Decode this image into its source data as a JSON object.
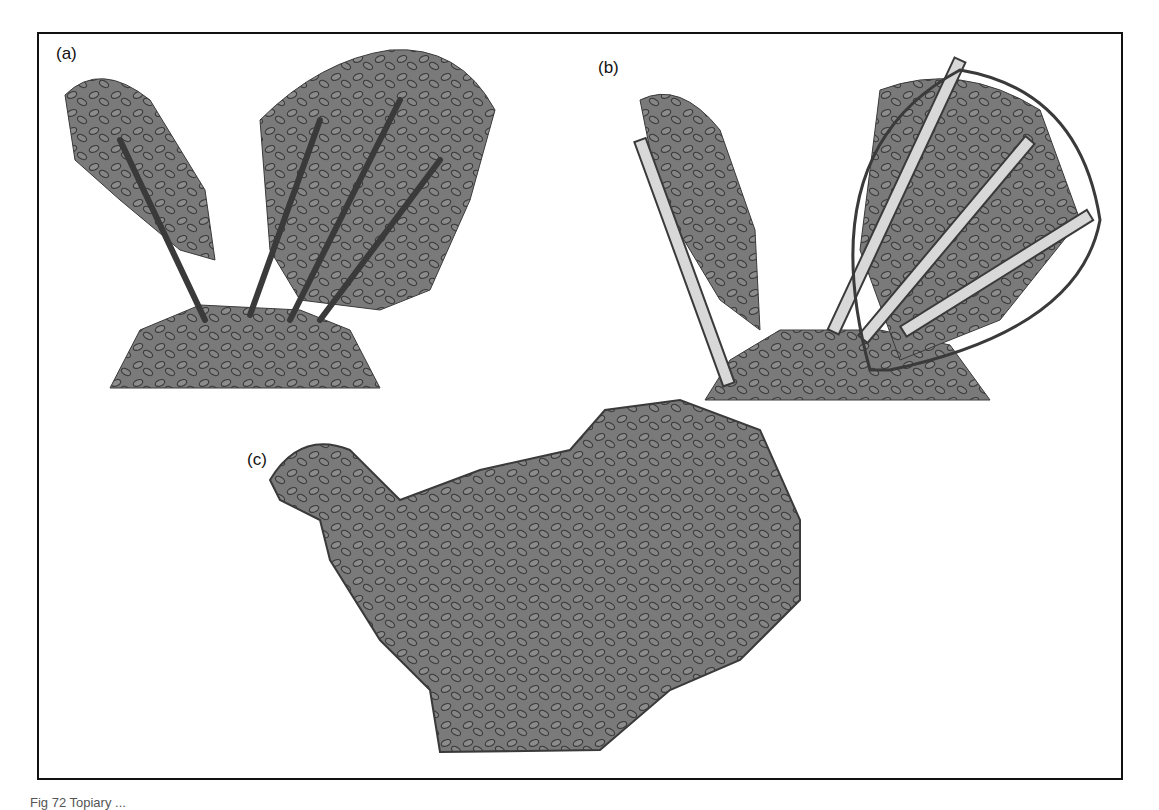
{
  "figure": {
    "panels": [
      {
        "id": "a",
        "label": "(a)",
        "description": "Multi-stemmed shrub before training"
      },
      {
        "id": "b",
        "label": "(b)",
        "description": "Shrub stems tied to bamboo canes within a wire hoop frame"
      },
      {
        "id": "c",
        "label": "(c)",
        "description": "Finished topiary bird shape"
      }
    ],
    "caption": "Fig 72 Topiary ..."
  },
  "colors": {
    "frame": "#111111",
    "foliage": "#7a7a7a",
    "foliage_outline": "#3a3a3a",
    "cane": "#d8d8d8",
    "background": "#ffffff"
  }
}
